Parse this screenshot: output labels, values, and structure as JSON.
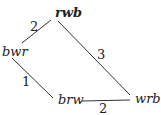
{
  "nodes": {
    "rwb": "rwb",
    "bwr": "bwr",
    "brw": "brw",
    "wrb": "wrb"
  },
  "edges": [
    {
      "from": "rwb",
      "to": "bwr",
      "weight": "2"
    },
    {
      "from": "rwb",
      "to": "wrb",
      "weight": "3"
    },
    {
      "from": "bwr",
      "to": "brw",
      "weight": "1"
    },
    {
      "from": "brw",
      "to": "wrb",
      "weight": "2"
    }
  ]
}
